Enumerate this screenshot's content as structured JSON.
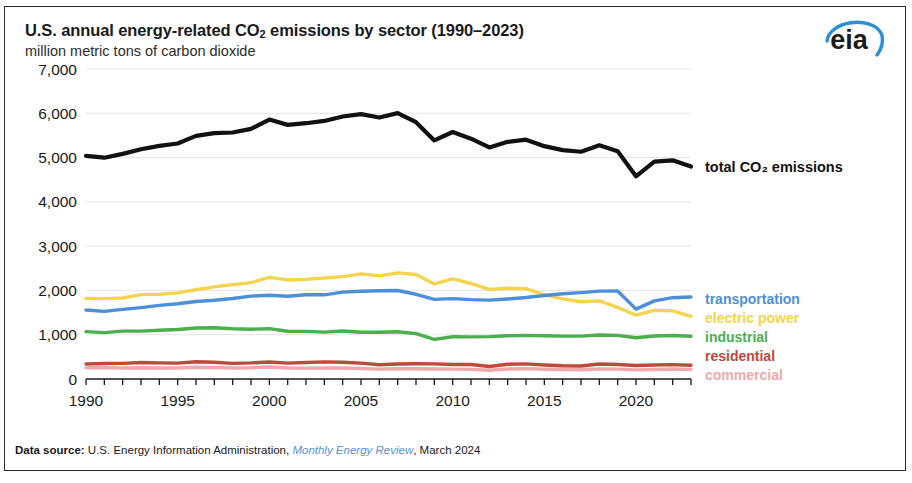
{
  "header": {
    "title_main": "U.S. annual energy-related CO",
    "title_sub": "2",
    "title_rest": " emissions by sector (1990–2023)",
    "subtitle": "million metric tons of carbon dioxide",
    "logo_text": "eia"
  },
  "footer": {
    "label": "Data source:",
    "agency": " U.S. Energy Information Administration, ",
    "publication": "Monthly Energy Review",
    "date": ", March 2024"
  },
  "colors": {
    "total": "#111111",
    "transportation": "#4d90d9",
    "electric_power": "#f4d44e",
    "industrial": "#4cae4f",
    "residential": "#c0483d",
    "commercial": "#eda9ad",
    "grid": "#e4e4e4",
    "axis": "#1a1a1a",
    "frame": "#2b2b2b",
    "link": "#5b8fd4"
  },
  "chart_data": {
    "type": "line",
    "title": "U.S. annual energy-related CO2 emissions by sector (1990–2023)",
    "subtitle": "million metric tons of carbon dioxide",
    "xlabel": "",
    "ylabel": "million metric tons of carbon dioxide",
    "ylim": [
      0,
      7000
    ],
    "xlim": [
      1990,
      2023
    ],
    "ytick_labels": [
      "7,000",
      "6,000",
      "5,000",
      "4,000",
      "3,000",
      "2,000",
      "1,000",
      "0"
    ],
    "ytick_values": [
      7000,
      6000,
      5000,
      4000,
      3000,
      2000,
      1000,
      0
    ],
    "xtick_labels": [
      "1990",
      "1995",
      "2000",
      "2005",
      "2010",
      "2015",
      "2020"
    ],
    "xtick_values": [
      1990,
      1995,
      2000,
      2005,
      2010,
      2015,
      2020
    ],
    "minor_xticks_every": 1,
    "grid": true,
    "grid_axis": "y",
    "legend_position": "right-inline",
    "x": [
      1990,
      1991,
      1992,
      1993,
      1994,
      1995,
      1996,
      1997,
      1998,
      1999,
      2000,
      2001,
      2002,
      2003,
      2004,
      2005,
      2006,
      2007,
      2008,
      2009,
      2010,
      2011,
      2012,
      2013,
      2014,
      2015,
      2016,
      2017,
      2018,
      2019,
      2020,
      2021,
      2022,
      2023
    ],
    "series": [
      {
        "name": "total CO2 emissions",
        "label": "total CO₂ emissions",
        "color": "#111111",
        "values": [
          5039,
          4997,
          5083,
          5188,
          5264,
          5318,
          5489,
          5553,
          5566,
          5647,
          5859,
          5738,
          5776,
          5827,
          5927,
          5982,
          5904,
          6003,
          5798,
          5387,
          5577,
          5427,
          5229,
          5355,
          5404,
          5258,
          5169,
          5131,
          5277,
          5144,
          4577,
          4908,
          4937,
          4797
        ]
      },
      {
        "name": "transportation",
        "label": "transportation",
        "color": "#4d90d9",
        "values": [
          1559,
          1527,
          1572,
          1613,
          1662,
          1700,
          1750,
          1778,
          1817,
          1871,
          1891,
          1868,
          1901,
          1901,
          1961,
          1983,
          1992,
          1999,
          1913,
          1798,
          1816,
          1793,
          1780,
          1807,
          1839,
          1886,
          1925,
          1950,
          1984,
          1988,
          1577,
          1764,
          1836,
          1850
        ]
      },
      {
        "name": "electric power",
        "label": "electric power",
        "color": "#f4d44e",
        "values": [
          1820,
          1816,
          1830,
          1906,
          1915,
          1944,
          2015,
          2081,
          2132,
          2177,
          2296,
          2237,
          2250,
          2280,
          2313,
          2375,
          2328,
          2397,
          2359,
          2146,
          2259,
          2157,
          2022,
          2050,
          2039,
          1900,
          1809,
          1744,
          1763,
          1618,
          1440,
          1552,
          1539,
          1415
        ]
      },
      {
        "name": "industrial",
        "label": "industrial",
        "color": "#4cae4f",
        "values": [
          1069,
          1047,
          1080,
          1081,
          1102,
          1119,
          1150,
          1158,
          1135,
          1124,
          1136,
          1078,
          1076,
          1059,
          1085,
          1057,
          1055,
          1068,
          1024,
          895,
          953,
          952,
          957,
          977,
          986,
          975,
          968,
          969,
          994,
          985,
          932,
          970,
          983,
          967
        ]
      },
      {
        "name": "residential",
        "label": "residential",
        "color": "#c0483d",
        "values": [
          339,
          349,
          352,
          372,
          364,
          359,
          388,
          377,
          352,
          363,
          384,
          359,
          372,
          386,
          379,
          358,
          322,
          339,
          344,
          341,
          329,
          327,
          282,
          332,
          341,
          317,
          298,
          294,
          338,
          328,
          306,
          317,
          324,
          310
        ]
      },
      {
        "name": "commercial",
        "label": "commercial",
        "color": "#eda9ad",
        "values": [
          253,
          257,
          249,
          255,
          250,
          250,
          267,
          259,
          250,
          255,
          272,
          250,
          246,
          252,
          247,
          237,
          222,
          232,
          231,
          227,
          222,
          217,
          197,
          227,
          234,
          219,
          213,
          208,
          226,
          223,
          206,
          214,
          225,
          214
        ]
      }
    ],
    "series_labels_right": [
      {
        "label": "transportation",
        "color": "#4d90d9"
      },
      {
        "label": "electric power",
        "color": "#f4d44e"
      },
      {
        "label": "industrial",
        "color": "#4cae4f"
      },
      {
        "label": "residential",
        "color": "#c0483d"
      },
      {
        "label": "commercial",
        "color": "#eda9ad"
      }
    ]
  }
}
